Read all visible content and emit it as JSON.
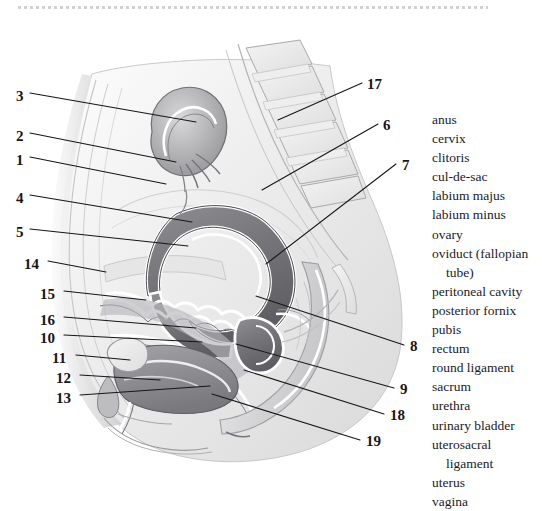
{
  "figure": {
    "type": "anatomical-illustration",
    "style": "grayscale pencil / wash medical illustration",
    "background_color": "#ffffff",
    "ink_color": "#16161a"
  },
  "legend": {
    "items": [
      {
        "label": "anus"
      },
      {
        "label": "cervix"
      },
      {
        "label": "clitoris"
      },
      {
        "label": "cul-de-sac"
      },
      {
        "label": "labium majus"
      },
      {
        "label": "labium minus"
      },
      {
        "label": "ovary"
      },
      {
        "label": "oviduct (fallopian",
        "continuation": "tube)"
      },
      {
        "label": "peritoneal cavity"
      },
      {
        "label": "posterior fornix"
      },
      {
        "label": "pubis"
      },
      {
        "label": "rectum"
      },
      {
        "label": "round ligament"
      },
      {
        "label": "sacrum"
      },
      {
        "label": "urethra"
      },
      {
        "label": "urinary bladder"
      },
      {
        "label": "uterosacral",
        "continuation": "ligament"
      },
      {
        "label": "uterus"
      },
      {
        "label": "vagina"
      }
    ]
  },
  "callouts": [
    {
      "number": "3",
      "x": 16,
      "y": 89,
      "side": "left"
    },
    {
      "number": "2",
      "x": 16,
      "y": 129,
      "side": "left"
    },
    {
      "number": "1",
      "x": 16,
      "y": 153,
      "side": "left"
    },
    {
      "number": "4",
      "x": 16,
      "y": 191,
      "side": "left"
    },
    {
      "number": "5",
      "x": 16,
      "y": 225,
      "side": "left"
    },
    {
      "number": "14",
      "x": 24,
      "y": 257,
      "side": "left"
    },
    {
      "number": "15",
      "x": 40,
      "y": 287,
      "side": "left"
    },
    {
      "number": "16",
      "x": 40,
      "y": 313,
      "side": "left"
    },
    {
      "number": "10",
      "x": 40,
      "y": 331,
      "side": "left"
    },
    {
      "number": "11",
      "x": 52,
      "y": 351,
      "side": "left"
    },
    {
      "number": "12",
      "x": 56,
      "y": 371,
      "side": "left"
    },
    {
      "number": "13",
      "x": 56,
      "y": 391,
      "side": "left"
    },
    {
      "number": "17",
      "x": 367,
      "y": 77,
      "side": "right"
    },
    {
      "number": "6",
      "x": 383,
      "y": 118,
      "side": "right"
    },
    {
      "number": "7",
      "x": 402,
      "y": 158,
      "side": "right"
    },
    {
      "number": "8",
      "x": 410,
      "y": 339,
      "side": "right"
    },
    {
      "number": "9",
      "x": 400,
      "y": 382,
      "side": "right"
    },
    {
      "number": "18",
      "x": 390,
      "y": 408,
      "side": "right"
    },
    {
      "number": "19",
      "x": 366,
      "y": 434,
      "side": "right"
    }
  ]
}
